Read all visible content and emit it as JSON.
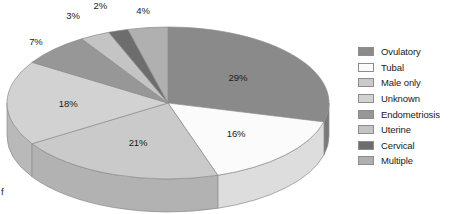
{
  "chart_data": {
    "type": "pie",
    "title": "",
    "subtitle": "",
    "xlabel": "",
    "ylabel": "",
    "three_d": true,
    "grid": false,
    "legend_position": "right",
    "value_suffix": "%",
    "total": 100,
    "categories": [
      "Ovulatory",
      "Tubal",
      "Male only",
      "Unknown",
      "Endometriosis",
      "Uterine",
      "Cervical",
      "Multiple"
    ],
    "values": [
      29,
      16,
      21,
      18,
      7,
      3,
      2,
      4
    ],
    "labels": [
      "29%",
      "16%",
      "21%",
      "18%",
      "7%",
      "3%",
      "2%",
      "4%"
    ],
    "colors": [
      "#8a8a8a",
      "#fbfbfb",
      "#cacaca",
      "#d2d2d2",
      "#979797",
      "#c4c4c4",
      "#6d6d6d",
      "#b0b0b0"
    ],
    "slices": [
      {
        "label": "Ovulatory",
        "value": 29,
        "display": "29%",
        "color": "#8a8a8a"
      },
      {
        "label": "Tubal",
        "value": 16,
        "display": "16%",
        "color": "#fbfbfb"
      },
      {
        "label": "Male only",
        "value": 21,
        "display": "21%",
        "color": "#cacaca"
      },
      {
        "label": "Unknown",
        "value": 18,
        "display": "18%",
        "color": "#d2d2d2"
      },
      {
        "label": "Endometriosis",
        "value": 7,
        "display": "7%",
        "color": "#979797"
      },
      {
        "label": "Uterine",
        "value": 3,
        "display": "3%",
        "color": "#c4c4c4"
      },
      {
        "label": "Cervical",
        "value": 2,
        "display": "2%",
        "color": "#6d6d6d"
      },
      {
        "label": "Multiple",
        "value": 4,
        "display": "4%",
        "color": "#b0b0b0"
      }
    ]
  },
  "legend": {
    "items": [
      {
        "label": "Ovulatory",
        "color": "#8a8a8a"
      },
      {
        "label": "Tubal",
        "color": "#fbfbfb"
      },
      {
        "label": "Male only",
        "color": "#cacaca"
      },
      {
        "label": "Unknown",
        "color": "#d2d2d2"
      },
      {
        "label": "Endometriosis",
        "color": "#979797"
      },
      {
        "label": "Uterine",
        "color": "#c4c4c4"
      },
      {
        "label": "Cervical",
        "color": "#6d6d6d"
      },
      {
        "label": "Multiple",
        "color": "#b0b0b0"
      }
    ]
  },
  "caption": {
    "fragment": "f"
  }
}
